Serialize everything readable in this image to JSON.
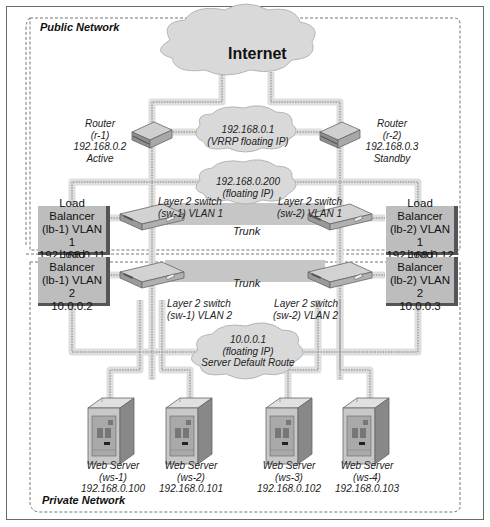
{
  "zones": {
    "public": "Public Network",
    "private": "Private Network"
  },
  "internet": {
    "label": "Internet",
    "icon": "cloud-icon"
  },
  "routers": [
    {
      "line1": "Router",
      "line2": "(r-1)",
      "line3": "192.168.0.2",
      "line4": "Active"
    },
    {
      "line1": "Router",
      "line2": "(r-2)",
      "line3": "192.168.0.3",
      "line4": "Standby"
    }
  ],
  "floating_ips": {
    "vrrp": {
      "line1": "192.168.0.1",
      "line2": "(VRRP floating IP)"
    },
    "lb": {
      "line1": "192.168.0.200",
      "line2": "(floating IP)"
    },
    "server_route": {
      "line1": "10.0.0.1",
      "line2": "(floating IP)",
      "line3": "Server Default Route"
    }
  },
  "switches": {
    "sw1_vlan1": {
      "line1": "Layer 2 switch",
      "line2": "(sw-1) VLAN 1"
    },
    "sw2_vlan1": {
      "line1": "Layer 2 switch",
      "line2": "(sw-2) VLAN 1"
    },
    "sw1_vlan2": {
      "line1": "Layer 2 switch",
      "line2": "(sw-1) VLAN 2"
    },
    "sw2_vlan2": {
      "line1": "Layer 2 switch",
      "line2": "(sw-2) VLAN 2"
    }
  },
  "trunks": {
    "top": "Trunk",
    "bottom": "Trunk"
  },
  "load_balancers": {
    "lb1_vlan1": {
      "line1": "Load Balancer",
      "line2": "(lb-1) VLAN 1",
      "line3": "192.168.0.11"
    },
    "lb1_vlan2": {
      "line1": "Load Balancer",
      "line2": "(lb-1) VLAN 2",
      "line3": "10.0.0.2"
    },
    "lb2_vlan1": {
      "line1": "Load Balancer",
      "line2": "(lb-2) VLAN 1",
      "line3": "192.168.0.12"
    },
    "lb2_vlan2": {
      "line1": "Load Balancer",
      "line2": "(lb-2) VLAN 2",
      "line3": "10.0.0.3"
    }
  },
  "web_servers": [
    {
      "line1": "Web Server",
      "line2": "(ws-1)",
      "line3": "192.168.0.100"
    },
    {
      "line1": "Web Server",
      "line2": "(ws-2)",
      "line3": "192.168.0.101"
    },
    {
      "line1": "Web Server",
      "line2": "(ws-3)",
      "line3": "192.168.0.102"
    },
    {
      "line1": "Web Server",
      "line2": "(ws-4)",
      "line3": "192.168.0.103"
    }
  ],
  "colors": {
    "cloud": "#d9d9d9",
    "link_glow": "#dcdcdc",
    "device": "#b5b5b5",
    "lb_box": "#bdbdbd",
    "trunk_band": "#c4c4c4"
  }
}
